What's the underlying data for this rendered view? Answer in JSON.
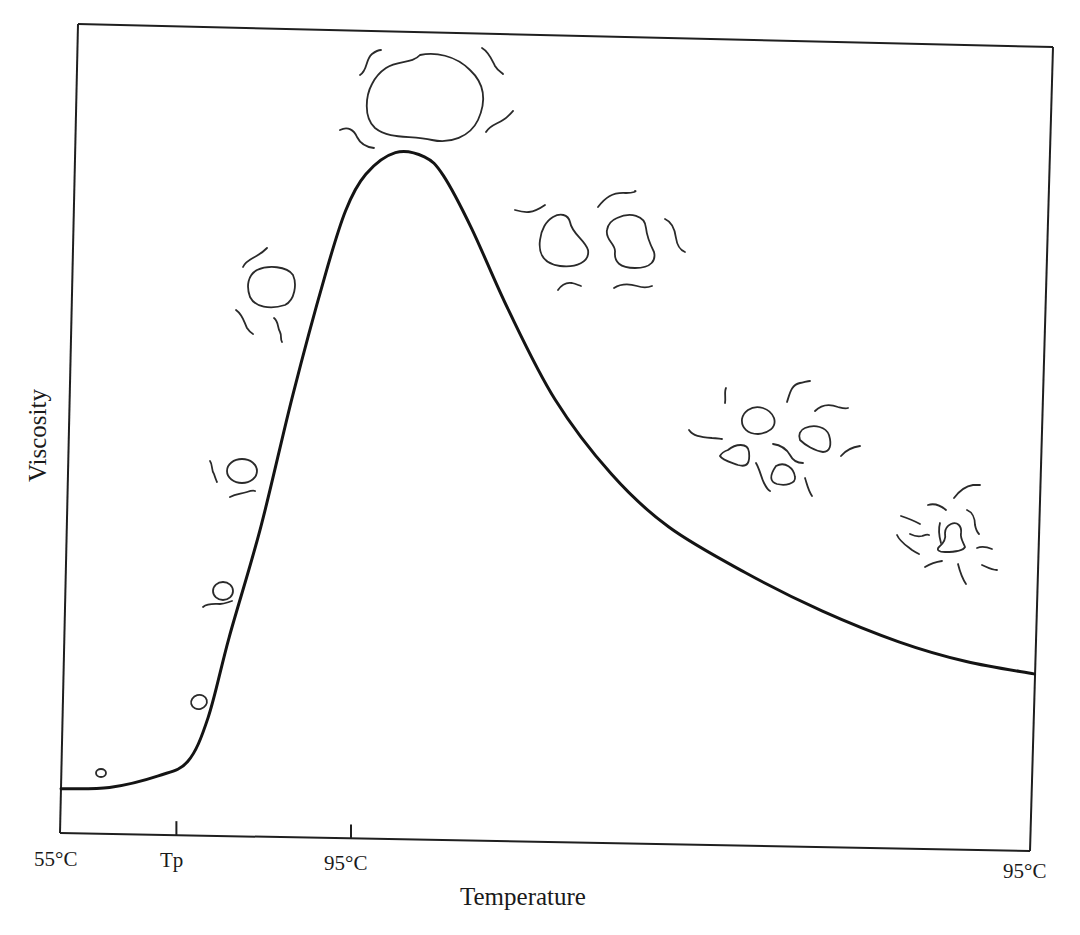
{
  "chart_data": {
    "type": "line",
    "title": "",
    "xlabel": "Temperature",
    "ylabel": "Viscosity",
    "x_tick_labels": [
      "55°C",
      "Tp",
      "95°C",
      "95°C"
    ],
    "x_ticks": [
      0,
      0.12,
      0.3,
      1.0
    ],
    "y_ticks": [],
    "xlim": [
      0,
      1
    ],
    "ylim": [
      0,
      1
    ],
    "grid": false,
    "legend": "none",
    "series": [
      {
        "name": "Viscosity curve",
        "x": [
          0,
          0.05,
          0.1,
          0.13,
          0.15,
          0.17,
          0.2,
          0.23,
          0.26,
          0.28,
          0.3,
          0.33,
          0.36,
          0.38,
          0.41,
          0.45,
          0.5,
          0.56,
          0.62,
          0.7,
          0.78,
          0.86,
          0.93,
          1.0
        ],
        "y": [
          0.06,
          0.063,
          0.08,
          0.1,
          0.16,
          0.27,
          0.42,
          0.6,
          0.76,
          0.85,
          0.9,
          0.93,
          0.925,
          0.9,
          0.83,
          0.72,
          0.6,
          0.5,
          0.43,
          0.37,
          0.32,
          0.28,
          0.255,
          0.24
        ]
      }
    ],
    "annotations": [
      {
        "label": "starch-granule-sketch",
        "stage": "native granule",
        "x": 0.04,
        "y": 0.07
      },
      {
        "label": "starch-granule-sketch",
        "stage": "slightly swollen granule",
        "x": 0.14,
        "y": 0.17
      },
      {
        "label": "starch-granule-sketch",
        "stage": "swelling granule",
        "x": 0.16,
        "y": 0.33
      },
      {
        "label": "starch-granule-sketch",
        "stage": "swelling granule with leached amylose",
        "x": 0.18,
        "y": 0.5
      },
      {
        "label": "starch-granule-sketch",
        "stage": "highly swollen granule",
        "x": 0.2,
        "y": 0.7
      },
      {
        "label": "starch-granule-sketch",
        "stage": "maximally swollen granule (peak)",
        "x": 0.37,
        "y": 1.0
      },
      {
        "label": "starch-granule-sketch",
        "stage": "deforming granules",
        "x": 0.58,
        "y": 0.8
      },
      {
        "label": "starch-granule-sketch",
        "stage": "fragmenting granules",
        "x": 0.76,
        "y": 0.5
      },
      {
        "label": "starch-granule-sketch",
        "stage": "disintegrated granule",
        "x": 0.92,
        "y": 0.35
      }
    ]
  }
}
